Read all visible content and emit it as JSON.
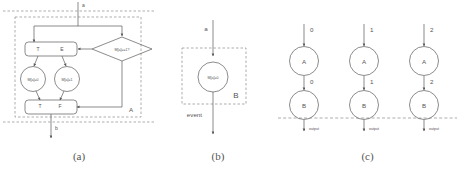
{
  "figure": {
    "panels": [
      {
        "id": "a",
        "caption": "(a)",
        "region_label": "A",
        "input_label": "a",
        "output_label": "b",
        "decision": "M[a]==1?",
        "fork_true": "T",
        "fork_else": "E",
        "join_true": "T",
        "join_false": "F",
        "action_left": "M[a]=0",
        "action_right": "M[a]=1"
      },
      {
        "id": "b",
        "caption": "(b)",
        "region_label": "B",
        "input_label": "a",
        "output_label": "event",
        "action": "M[a]=0"
      },
      {
        "id": "c",
        "caption": "(c)",
        "columns": [
          {
            "in_label": "0",
            "node_top": "A",
            "mid_label": "0",
            "node_bottom": "B",
            "out_label": "output"
          },
          {
            "in_label": "1",
            "node_top": "A",
            "mid_label": "1",
            "node_bottom": "B",
            "out_label": "output"
          },
          {
            "in_label": "2",
            "node_top": "A",
            "mid_label": "2",
            "node_bottom": "B",
            "out_label": "output"
          }
        ]
      }
    ]
  },
  "colors": {
    "stroke": "#5a5a5a",
    "dashed": "#8a8a8a",
    "text": "#555555",
    "background": "#ffffff"
  }
}
